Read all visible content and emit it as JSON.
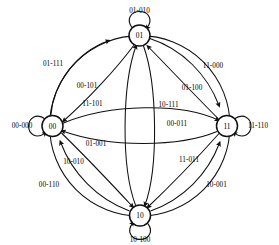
{
  "diagram": {
    "type": "finite-state-machine",
    "states": [
      {
        "id": "s01",
        "label": "01",
        "position": "top",
        "cx": 139.5,
        "cy": 35.5,
        "r": 10.5
      },
      {
        "id": "s00",
        "label": "00",
        "position": "left",
        "cx": 52.5,
        "cy": 126.0,
        "r": 10.5
      },
      {
        "id": "s11",
        "label": "11",
        "position": "right",
        "cx": 227.0,
        "cy": 126.0,
        "r": 10.5
      },
      {
        "id": "s10",
        "label": "10",
        "position": "bottom",
        "cx": 140.0,
        "cy": 215.5,
        "r": 10.5
      }
    ],
    "self_loops": [
      {
        "id": "loop-01",
        "state": "01",
        "label": "01-010",
        "label_x": 139.5,
        "label_y": 10.5,
        "side": "top"
      },
      {
        "id": "loop-00",
        "state": "00",
        "label": "00-000",
        "label_x": 22.0,
        "label_y": 126.0,
        "side": "left"
      },
      {
        "id": "loop-11",
        "state": "11",
        "label": "11-110",
        "label_x": 258.0,
        "label_y": 126.0,
        "side": "right"
      },
      {
        "id": "loop-10",
        "state": "10",
        "label": "10-100",
        "label_x": 140.0,
        "label_y": 240.0,
        "side": "bottom"
      }
    ],
    "transitions": [
      {
        "id": "e-00-01-outer",
        "from": "00",
        "to": "01",
        "label": "01-111",
        "label_x": 53.0,
        "label_y": 64.0
      },
      {
        "id": "e-01-00-inner",
        "from": "01",
        "to": "00",
        "label": "00-101",
        "label_x": 87.0,
        "label_y": 86.0
      },
      {
        "id": "e-00-11-upper",
        "from": "00",
        "to": "11",
        "label": "11-101",
        "label_x": 92.5,
        "label_y": 104.0
      },
      {
        "id": "e-01-11-outer",
        "from": "01",
        "to": "11",
        "label": "11-000",
        "label_x": 213.0,
        "label_y": 65.5
      },
      {
        "id": "e-11-01-inner",
        "from": "11",
        "to": "01",
        "label": "01-100",
        "label_x": 192.0,
        "label_y": 87.5
      },
      {
        "id": "e-01-10-center",
        "from": "01",
        "to": "10",
        "label": "10-111",
        "label_x": 168.5,
        "label_y": 104.5
      },
      {
        "id": "e-11-00-inner",
        "from": "11",
        "to": "00",
        "label": "00-011",
        "label_x": 177.0,
        "label_y": 123.5
      },
      {
        "id": "e-10-01-center",
        "from": "10",
        "to": "01",
        "label": "01-001",
        "label_x": 96.0,
        "label_y": 143.5
      },
      {
        "id": "e-00-10-inner",
        "from": "00",
        "to": "10",
        "label": "10-010",
        "label_x": 73.5,
        "label_y": 161.5
      },
      {
        "id": "e-11-10-inner",
        "from": "11",
        "to": "10",
        "label": "11-011",
        "label_x": 189.0,
        "label_y": 160.0
      },
      {
        "id": "e-10-00-outer",
        "from": "10",
        "to": "00",
        "label": "00-110",
        "label_x": 49.0,
        "label_y": 185.0
      },
      {
        "id": "e-10-11-outer",
        "from": "10",
        "to": "11",
        "label": "10-001",
        "label_x": 216.5,
        "label_y": 184.5
      }
    ],
    "style": {
      "stroke_color": "#111111",
      "node_fill": "#ffffff",
      "background": "#ffffff",
      "node_radius": 10.5,
      "outer_ring_radius": 90.0
    }
  }
}
